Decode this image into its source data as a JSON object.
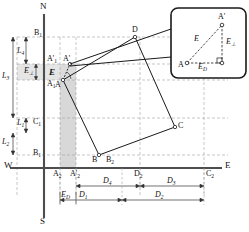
{
  "figure": {
    "type": "survey-displacement-diagram",
    "compass": {
      "north": "N",
      "south": "S",
      "east": "E",
      "west": "W"
    },
    "axis": {
      "vertical_name": "north-south-axis",
      "horizontal_name": "west-east-axis"
    },
    "shape": {
      "name": "rotated-building-footprint",
      "vertices": [
        "A",
        "D",
        "C",
        "B"
      ],
      "displaced_vertex": "A'"
    },
    "vertex_labels": {
      "A": "A",
      "A_prime": "A'",
      "B": "B",
      "C": "C",
      "D": "D",
      "E_at_A": "E"
    },
    "projection_labels": {
      "B1": "B",
      "B1_sub": "1",
      "A1": "A",
      "A1_sub": "1",
      "A1p": "A'",
      "A1p_sub": "1",
      "EL": "E",
      "EL_sub": "⊥",
      "C1": "C",
      "C1_sub": "1",
      "B1b": "B",
      "B1b_sub": "1",
      "A2": "A",
      "A2_sub": "2",
      "A2p": "A'",
      "A2p_sub": "2",
      "B2": "B",
      "B2_sub": "2",
      "D2": "D",
      "D2_sub": "2",
      "C2": "C",
      "C2_sub": "2"
    },
    "vertical_dimensions": [
      {
        "label": "L",
        "sub": "4",
        "name": "dim-L4"
      },
      {
        "label": "L",
        "sub": "3",
        "name": "dim-L3"
      },
      {
        "label": "L",
        "sub": "1",
        "name": "dim-L1"
      },
      {
        "label": "L",
        "sub": "2",
        "name": "dim-L2"
      }
    ],
    "horizontal_dimensions": [
      {
        "label": "D",
        "sub": "4",
        "name": "dim-D4"
      },
      {
        "label": "D",
        "sub": "3",
        "name": "dim-D3"
      },
      {
        "label": "D",
        "sub": "1",
        "name": "dim-D1"
      },
      {
        "label": "D",
        "sub": "2",
        "name": "dim-D2"
      },
      {
        "label": "E",
        "sub": "D",
        "name": "dim-ED"
      }
    ],
    "inset": {
      "name": "displacement-detail-inset",
      "points": {
        "A": "A",
        "A_prime": "A'"
      },
      "vector_total": {
        "label": "E",
        "sub": ""
      },
      "vector_perp": {
        "label": "E",
        "sub": "⊥"
      },
      "vector_along": {
        "label": "E",
        "sub": "D"
      },
      "right_angle_marker": true
    },
    "colors": {
      "line": "#1a1a1a",
      "dashed": "#9a9a9a",
      "shade": "#d4d4d4",
      "axis": "#555555",
      "text": "#111111"
    }
  }
}
